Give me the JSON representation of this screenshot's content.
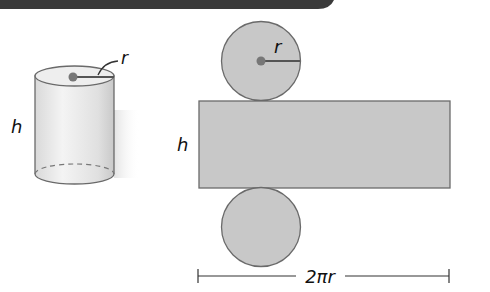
{
  "header_bar": {
    "color": "#3a3a3a"
  },
  "cylinder": {
    "height_label": "h",
    "radius_label": "r",
    "body_color": "#e6e6e6",
    "outline_color": "#6a6a6a"
  },
  "net": {
    "top_circle_radius_label": "r",
    "rectangle_height_label": "h",
    "width_label": "2πr",
    "fill_color": "#c8c8c8",
    "outline_color": "#6a6a6a"
  }
}
